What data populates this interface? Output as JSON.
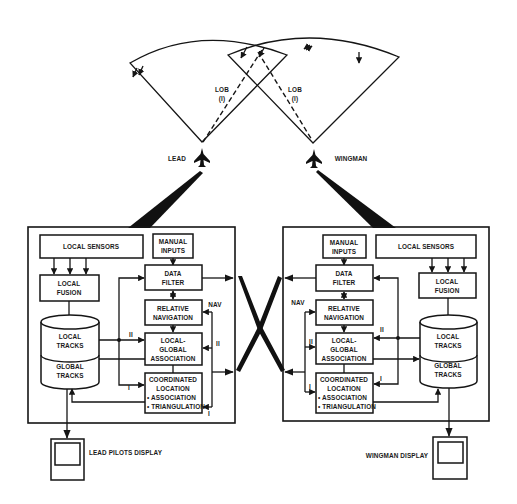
{
  "diagram": {
    "type": "coordinated sensor fusion block diagram (two-aircraft)",
    "sensor_coverage": {
      "lob_left": {
        "line1": "LOB",
        "line2": "(I)"
      },
      "lob_right": {
        "line1": "LOB",
        "line2": "(I)"
      }
    },
    "aircraft": {
      "lead_label": "LEAD",
      "wingman_label": "WINGMAN"
    },
    "lead_system": {
      "local_sensors": "LOCAL SENSORS",
      "local_fusion": [
        "LOCAL",
        "FUSION"
      ],
      "manual_inputs": [
        "MANUAL",
        "INPUTS"
      ],
      "data_filter": [
        "DATA",
        "FILTER"
      ],
      "relative_navigation": [
        "RELATIVE",
        "NAVIGATION"
      ],
      "local_global_association": [
        "LOCAL-",
        "GLOBAL",
        "ASSOCIATION"
      ],
      "coordinated_location": [
        "COORDINATED",
        "LOCATION",
        "• ASSOCIATION",
        "• TRIANGULATION"
      ],
      "track_db": {
        "top": [
          "LOCAL",
          "TRACKS"
        ],
        "bottom": [
          "GLOBAL",
          "TRACKS"
        ]
      },
      "link_labels": {
        "nav": "NAV",
        "ii_right": "II",
        "ii_left": "II",
        "i_right": "I",
        "i_left": "I"
      },
      "display_label": "LEAD PILOTS DISPLAY"
    },
    "wingman_system": {
      "local_sensors": "LOCAL SENSORS",
      "local_fusion": [
        "LOCAL",
        "FUSION"
      ],
      "manual_inputs": [
        "MANUAL",
        "INPUTS"
      ],
      "data_filter": [
        "DATA",
        "FILTER"
      ],
      "relative_navigation": [
        "RELATIVE",
        "NAVIGATION"
      ],
      "local_global_association": [
        "LOCAL-",
        "GLOBAL",
        "ASSOCIATION"
      ],
      "coordinated_location": [
        "COORDINATED",
        "LOCATION",
        "• ASSOCIATION",
        "• TRIANGULATION"
      ],
      "track_db": {
        "top": [
          "LOCAL",
          "TRACKS"
        ],
        "bottom": [
          "GLOBAL",
          "TRACKS"
        ]
      },
      "link_labels": {
        "nav": "NAV",
        "ii_left": "II",
        "ii_right": "II",
        "i_left": "I",
        "i_right": "I"
      },
      "display_label": "WINGMAN DISPLAY"
    }
  }
}
